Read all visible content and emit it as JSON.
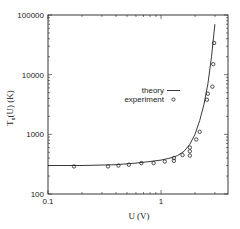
{
  "chart_data": {
    "type": "scatter",
    "title": "",
    "xlabel": "U (V)",
    "ylabel": "T_n(U) (K)",
    "xscale": "log",
    "yscale": "log",
    "xlim": [
      0.1,
      4
    ],
    "ylim": [
      100,
      100000
    ],
    "grid": false,
    "legend_position": "center-right",
    "x_ticks": [
      {
        "value": 0.1,
        "label": "0.1"
      },
      {
        "value": 1,
        "label": "1"
      }
    ],
    "y_ticks": [
      {
        "value": 100,
        "label": "100"
      },
      {
        "value": 1000,
        "label": "1000"
      },
      {
        "value": 10000,
        "label": "10000"
      },
      {
        "value": 100000,
        "label": "100000"
      }
    ],
    "series": [
      {
        "name": "theory",
        "style": "line",
        "x": [
          0.1,
          0.2,
          0.4,
          0.6,
          0.8,
          1.0,
          1.2,
          1.4,
          1.6,
          1.8,
          2.0,
          2.2,
          2.4,
          2.6,
          2.8,
          3.0
        ],
        "y": [
          300,
          300,
          310,
          330,
          350,
          370,
          400,
          440,
          520,
          680,
          1000,
          1700,
          3200,
          7000,
          20000,
          70000
        ]
      },
      {
        "name": "experiment",
        "style": "marker-circle",
        "x": [
          0.17,
          0.34,
          0.42,
          0.52,
          0.67,
          0.86,
          1.08,
          1.3,
          1.3,
          1.55,
          1.8,
          1.8,
          1.8,
          2.05,
          2.2,
          2.55,
          2.6,
          2.85,
          2.9,
          2.95
        ],
        "y": [
          290,
          290,
          300,
          310,
          330,
          330,
          350,
          360,
          400,
          450,
          520,
          600,
          440,
          820,
          1100,
          3800,
          4800,
          6300,
          15000,
          34000
        ]
      }
    ]
  },
  "legend": {
    "theory_label": "theory",
    "experiment_label": "experiment"
  },
  "axes": {
    "x_label": "U (V)",
    "y_label_main": "T",
    "y_label_sub": "n",
    "y_label_rest": "(U) (K)"
  }
}
